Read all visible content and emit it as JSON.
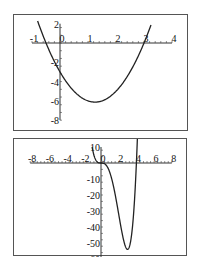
{
  "chart_data": [
    {
      "type": "line",
      "title": "",
      "xlabel": "",
      "ylabel": "",
      "function": "y = 2x^2 - 5x - 3",
      "xlim": [
        -1.1,
        4.3
      ],
      "ylim": [
        -8.5,
        2.8
      ],
      "x_ticks": [
        -1,
        0,
        1,
        2,
        3,
        4
      ],
      "x_tick_labels": [
        "-1",
        "0",
        "1",
        "2",
        "3",
        "4"
      ],
      "y_ticks": [
        2,
        -2,
        -4,
        -6,
        -8
      ],
      "y_tick_labels": [
        "2",
        "-2",
        "-4",
        "-6",
        "-8"
      ],
      "x_domain": [
        -0.8,
        3.25
      ],
      "key_points": {
        "y_intercept": -3,
        "roots": [
          -0.5,
          3
        ],
        "vertex": [
          1.25,
          -6.125
        ]
      },
      "grid": false,
      "legend": null,
      "line_color": "#222222",
      "frame": {
        "left": 13,
        "top": 14,
        "width": 175,
        "height": 117
      },
      "axis_pixel": {
        "x0": 46,
        "y0": 28,
        "px_per_x": 28,
        "px_per_y": 9.65
      }
    },
    {
      "type": "line",
      "title": "",
      "xlabel": "",
      "ylabel": "",
      "function": "y = 2x^4 - 8x^3",
      "xlim": [
        -9.2,
        9.2
      ],
      "ylim": [
        -63,
        14
      ],
      "x_ticks": [
        -8,
        -6,
        -4,
        -2,
        0,
        2,
        4,
        6,
        8
      ],
      "x_tick_labels": [
        "-8",
        "-6",
        "-4",
        "-2",
        "0",
        "2",
        "4",
        "6",
        "8"
      ],
      "y_ticks": [
        10,
        -10,
        -20,
        -30,
        -40,
        -50,
        -60
      ],
      "y_tick_labels": [
        "10",
        "-10",
        "-20",
        "-30",
        "-40",
        "-50",
        "-60"
      ],
      "x_domain": [
        -1.0,
        4.12
      ],
      "key_points": {
        "roots": [
          0,
          4
        ],
        "minimum": [
          3,
          -54
        ],
        "start": [
          -1,
          10
        ]
      },
      "grid": false,
      "legend": null,
      "line_color": "#222222",
      "frame": {
        "left": 13,
        "top": 138,
        "width": 174,
        "height": 118
      },
      "axis_pixel": {
        "x0": 87,
        "y0": 24,
        "px_per_x": 8.85,
        "px_per_y": 1.6
      }
    }
  ]
}
